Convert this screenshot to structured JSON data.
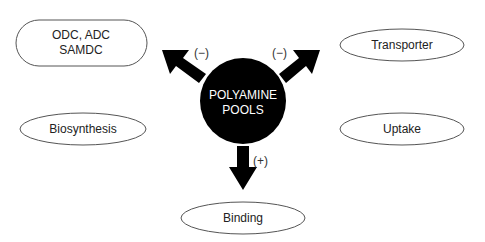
{
  "diagram": {
    "center": {
      "line1": "POLYAMINE",
      "line2": "POOLS"
    },
    "nodes": {
      "enzymes": {
        "line1": "ODC, ADC",
        "line2": "SAMDC"
      },
      "transporter": {
        "label": "Transporter"
      },
      "biosynthesis": {
        "label": "Biosynthesis"
      },
      "uptake": {
        "label": "Uptake"
      },
      "binding": {
        "label": "Binding"
      }
    },
    "arrows": {
      "to_enzymes": {
        "sign": "(−)"
      },
      "to_transporter": {
        "sign": "(−)"
      },
      "to_binding": {
        "sign": "(+)"
      }
    },
    "colors": {
      "stroke": "#555555",
      "center_fill": "#000000",
      "arrow_fill": "#000000",
      "center_text": "#ffffff"
    }
  }
}
